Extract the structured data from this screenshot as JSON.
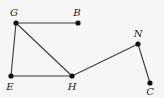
{
  "diagram": {
    "type": "graph",
    "background": "#f6f6f6",
    "line_color": "#3a3a3a",
    "point_color": "#111111",
    "points": [
      {
        "id": "G",
        "label": "G",
        "x": 16,
        "y": 23,
        "label_x": 14,
        "label_y": 16
      },
      {
        "id": "B",
        "label": "B",
        "x": 78,
        "y": 23,
        "label_x": 77,
        "label_y": 16
      },
      {
        "id": "E",
        "label": "E",
        "x": 11,
        "y": 76,
        "label_x": 10,
        "label_y": 90
      },
      {
        "id": "H",
        "label": "H",
        "x": 72,
        "y": 76,
        "label_x": 72,
        "label_y": 90
      },
      {
        "id": "N",
        "label": "N",
        "x": 138,
        "y": 44,
        "label_x": 138,
        "label_y": 37
      },
      {
        "id": "C",
        "label": "C",
        "x": 150,
        "y": 83,
        "label_x": 150,
        "label_y": 95
      }
    ],
    "edges": [
      {
        "from": "G",
        "to": "B"
      },
      {
        "from": "G",
        "to": "E"
      },
      {
        "from": "G",
        "to": "H"
      },
      {
        "from": "E",
        "to": "H"
      },
      {
        "from": "H",
        "to": "N"
      },
      {
        "from": "N",
        "to": "C"
      }
    ]
  }
}
